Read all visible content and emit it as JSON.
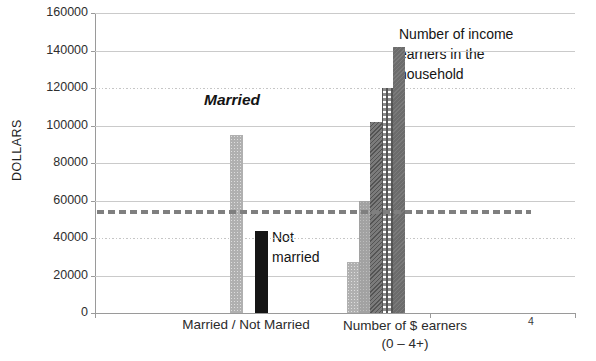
{
  "page": {
    "background": "#ffffff",
    "page_number": "4"
  },
  "chart_data": {
    "type": "bar",
    "title": "",
    "ylabel": "DOLLARS",
    "ylim": [
      0,
      160000
    ],
    "yticks": [
      0,
      20000,
      40000,
      60000,
      80000,
      100000,
      120000,
      140000,
      160000
    ],
    "ytick_labels": [
      "0",
      "20000",
      "40000",
      "60000",
      "80000",
      "100000",
      "120000",
      "140000",
      "160000"
    ],
    "dotted_gridlines": [
      40000,
      120000
    ],
    "grid": "horizontal",
    "legend": "none",
    "x_axis": {
      "category1": "Married  /  Not Married",
      "category2_line1": "Number of $ earners",
      "category2_line2": "(0 – 4+)"
    },
    "groups": [
      {
        "category": "Married / Not Married",
        "bars": [
          {
            "label": "Married",
            "value": 95000,
            "pattern": "speckled-light-gray"
          },
          {
            "label": "Not married",
            "value": 44000,
            "pattern": "solid-black"
          }
        ]
      },
      {
        "category": "Number of $ earners (0 - 4+)",
        "bars": [
          {
            "label": "0",
            "value": 27000,
            "pattern": "speckled-light-gray"
          },
          {
            "label": "1",
            "value": 60000,
            "pattern": "solid-medium-gray"
          },
          {
            "label": "2",
            "value": 102000,
            "pattern": "diagonal-dark-gray"
          },
          {
            "label": "3",
            "value": 120000,
            "pattern": "checkered-white-gray"
          },
          {
            "label": "4+",
            "value": 142000,
            "pattern": "solid-dark-gray"
          }
        ]
      }
    ],
    "reference_line": {
      "value": 54000,
      "style": "dashed",
      "color": "#7f7f7f"
    },
    "annotations": [
      {
        "text": "Married"
      },
      {
        "text": "Not married"
      },
      {
        "text": "Number of income earners in the household"
      }
    ],
    "colors": {
      "axis": "#9a9a9a",
      "gridline": "#cacaca",
      "text": "#262626"
    }
  }
}
